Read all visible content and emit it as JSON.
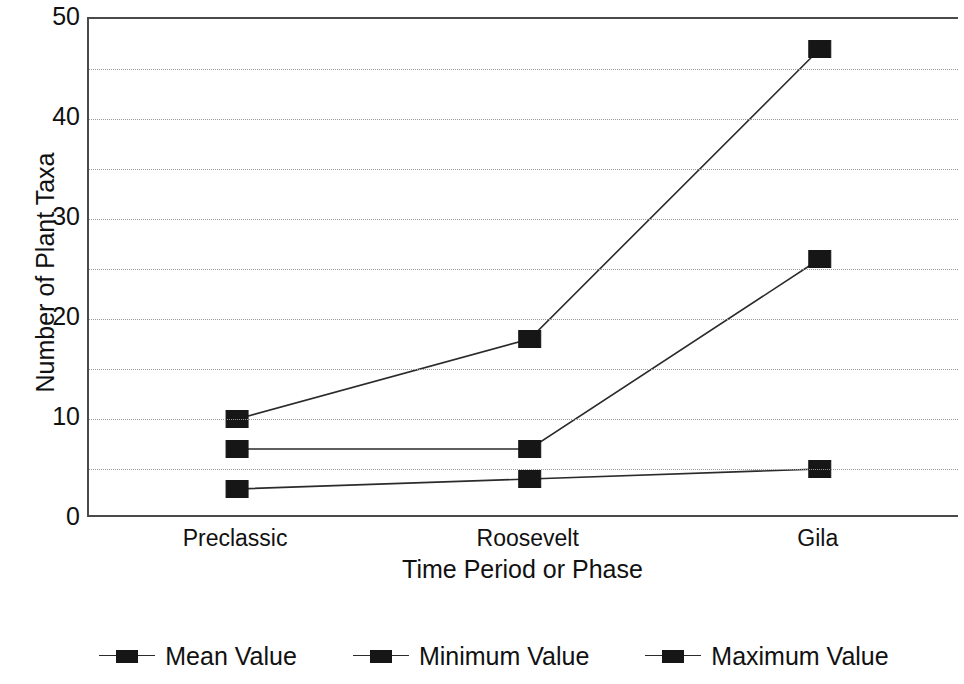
{
  "chart_data": {
    "type": "line",
    "title": "",
    "subtitle": "",
    "xlabel": "Time Period or Phase",
    "ylabel": "Number of Plant Taxa",
    "categories": [
      "Preclassic",
      "Roosevelt",
      "Gila"
    ],
    "series": [
      {
        "name": "Mean Value",
        "values": [
          7,
          7,
          26
        ]
      },
      {
        "name": "Minimum Value",
        "values": [
          3,
          4,
          5
        ]
      },
      {
        "name": "Maximum Value",
        "values": [
          10,
          18,
          47
        ]
      }
    ],
    "ylim": [
      0,
      50
    ],
    "y_ticks": [
      0,
      10,
      20,
      30,
      40,
      50
    ],
    "y_tick_labels": [
      "0",
      "10",
      "20",
      "30",
      "40",
      "50"
    ],
    "y_gridlines": [
      5,
      10,
      15,
      20,
      25,
      30,
      35,
      40,
      45
    ],
    "grid": "horizontal-dotted",
    "legend_position": "bottom",
    "marker": "square",
    "colors": {
      "series": "#161616",
      "line": "#2b2b2b",
      "axis": "#4a4a4a",
      "grid": "#9a9a9a",
      "text": "#111111",
      "background": "#ffffff"
    }
  },
  "legend": {
    "items": [
      {
        "label": "Mean Value"
      },
      {
        "label": "Minimum Value"
      },
      {
        "label": "Maximum Value"
      }
    ]
  }
}
